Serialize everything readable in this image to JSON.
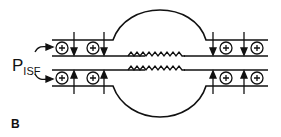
{
  "figure": {
    "panel_label": "B",
    "pressure_label": {
      "main": "P",
      "subscript": "ISF"
    },
    "colors": {
      "stroke": "#111111",
      "background": "#ffffff"
    },
    "elements": [
      "two parallel tube walls with expanding central chamber",
      "circled plus charges in wall segments",
      "arrows pointing toward lumen (down on top wall, up on bottom wall)",
      "zigzag springs in central channel"
    ]
  }
}
